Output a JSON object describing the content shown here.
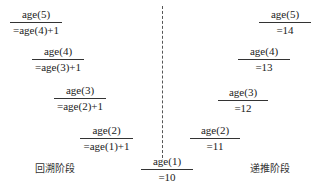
{
  "diagram": {
    "divider": "dashed-vertical-line",
    "left_phase_label": "回溯阶段",
    "right_phase_label": "递推阶段",
    "left_nodes": [
      {
        "top": "age(5)",
        "bottom": "=age(4)+1"
      },
      {
        "top": "age(4)",
        "bottom": "=age(3)+1"
      },
      {
        "top": "age(3)",
        "bottom": "=age(2)+1"
      },
      {
        "top": "age(2)",
        "bottom": "=age(1)+1"
      }
    ],
    "center_node": {
      "top": "age(1)",
      "bottom": "=10"
    },
    "right_nodes": [
      {
        "top": "age(5)",
        "bottom": "=14"
      },
      {
        "top": "age(4)",
        "bottom": "=13"
      },
      {
        "top": "age(3)",
        "bottom": "=12"
      },
      {
        "top": "age(2)",
        "bottom": "=11"
      }
    ]
  }
}
